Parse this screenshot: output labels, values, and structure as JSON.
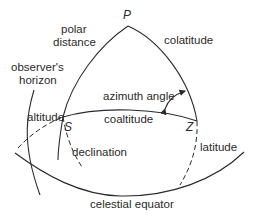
{
  "diagram": {
    "points": {
      "pole": "P",
      "star": "S",
      "zenith": "Z"
    },
    "labels": {
      "polar_distance_line1": "polar",
      "polar_distance_line2": "distance",
      "colatitude_top": "colatitude",
      "observers_horizon_line1": "observer's",
      "observers_horizon_line2": "horizon",
      "azimuth_angle": "azimuth angle",
      "altitude": "altitude",
      "coaltitude": "coaltitude",
      "declination": "declination",
      "latitude": "latitude",
      "celestial_equator": "celestial equator"
    },
    "colors": {
      "line": "#2a2a2a",
      "background": "#ffffff"
    }
  }
}
